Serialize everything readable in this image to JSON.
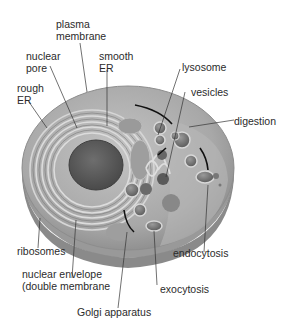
{
  "diagram": {
    "colors": {
      "cytoplasm": "#a9a9a9",
      "membrane": "#8d8d8d",
      "nucleus": "#5a5a5a",
      "label_text": "#2b2b2b",
      "leader_line": "#333333"
    },
    "labels": {
      "plasma_membrane": [
        "plasma",
        "membrane"
      ],
      "nuclear_pore": [
        "nuclear",
        "pore"
      ],
      "smooth_er": [
        "smooth",
        "ER"
      ],
      "rough_er": [
        "rough",
        "ER"
      ],
      "lysosome": "lysosome",
      "vesicles": "vesicles",
      "digestion": "digestion",
      "ribosomes": "ribosomes",
      "nuclear_envelope": [
        "nuclear envelope",
        "(double membrane"
      ],
      "endocytosis": "endocytosis",
      "exocytosis": "exocytosis",
      "golgi_apparatus": "Golgi apparatus"
    }
  }
}
